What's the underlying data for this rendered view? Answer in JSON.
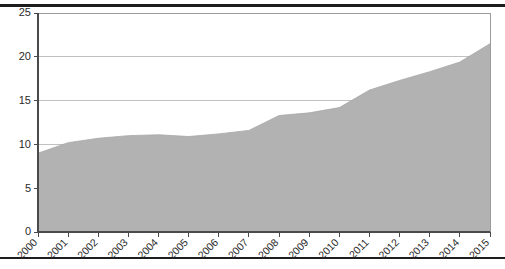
{
  "chart_data": {
    "type": "area",
    "title": "",
    "subtitle": "",
    "xlabel": "",
    "ylabel": "",
    "categories": [
      "2000",
      "2001",
      "2002",
      "2003",
      "2004",
      "2005",
      "2006",
      "2007",
      "2008",
      "2009",
      "2010",
      "2011",
      "2012",
      "2013",
      "2014",
      "2015"
    ],
    "values": [
      9.0,
      10.2,
      10.7,
      11.0,
      11.1,
      10.9,
      11.2,
      11.6,
      13.3,
      13.6,
      14.2,
      16.2,
      17.3,
      18.3,
      19.4,
      21.5
    ],
    "series": [
      {
        "name": "",
        "values": [
          9.0,
          10.2,
          10.7,
          11.0,
          11.1,
          10.9,
          11.2,
          11.6,
          13.3,
          13.6,
          14.2,
          16.2,
          17.3,
          18.3,
          19.4,
          21.5
        ]
      }
    ],
    "ylim": [
      0,
      25
    ],
    "yticks": [
      0,
      5,
      10,
      15,
      20,
      25
    ],
    "ytick_labels": [
      "0",
      "5",
      "10",
      "15",
      "20",
      "25"
    ],
    "xticks": [
      "2000",
      "2001",
      "2002",
      "2003",
      "2004",
      "2005",
      "2006",
      "2007",
      "2008",
      "2009",
      "2010",
      "2011",
      "2012",
      "2013",
      "2014",
      "2015"
    ],
    "grid": true,
    "grid_axis": "y",
    "legend": false,
    "legend_position": "none",
    "annotations": [],
    "colors": {
      "area_fill": "#b2b2b2",
      "gridline": "#b9b9b9",
      "axis": "#4a4a4a",
      "frame": "#9a9a9a",
      "text": "#2b2b2b",
      "background": "#ffffff",
      "page_rule": "#1d1d1d"
    },
    "xtick_label_rotation": -45
  },
  "layout": {
    "plot_left": 38,
    "plot_right": 490,
    "plot_top": 13,
    "plot_bottom": 232,
    "page_rule_top_y": 4,
    "page_rule_bottom_y": 257
  }
}
